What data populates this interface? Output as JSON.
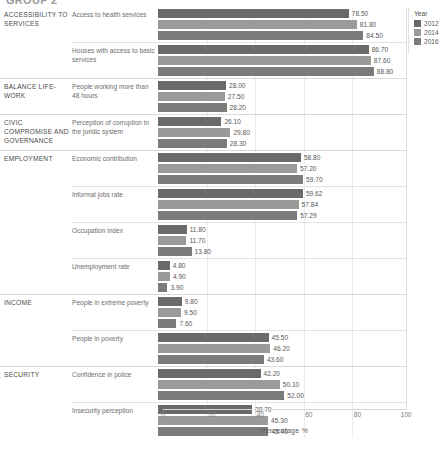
{
  "title": "GROUP 2",
  "axis": {
    "title": "Percentage %",
    "ticks": [
      "0",
      "20",
      "40",
      "60",
      "80",
      "100"
    ]
  },
  "legend": {
    "title": "Year",
    "items": [
      {
        "label": "2012",
        "color": "#6a6a6a"
      },
      {
        "label": "2014",
        "color": "#9a9a9a"
      },
      {
        "label": "2016",
        "color": "#7b7b7b"
      }
    ]
  },
  "chart_data": {
    "type": "bar",
    "orientation": "horizontal",
    "title": "GROUP 2",
    "xlabel": "Percentage %",
    "ylabel": "",
    "xlim": [
      0,
      100
    ],
    "xticks": [
      0,
      20,
      40,
      60,
      80,
      100
    ],
    "grid": true,
    "legend_title": "Year",
    "legend_position": "right",
    "series": [
      {
        "name": "2012",
        "color": "#6a6a6a"
      },
      {
        "name": "2014",
        "color": "#9a9a9a"
      },
      {
        "name": "2016",
        "color": "#7b7b7b"
      }
    ],
    "categories": [
      "Access to health services",
      "Houses with access to basic services",
      "People working more than 48 hours",
      "Perception of corruption in the juridic system",
      "Economic contribution",
      "Informal jobs rate",
      "Occupation index",
      "Unemployment rate",
      "People in extreme poverty",
      "People in poverty",
      "Confidence in police",
      "Insecurity perception"
    ],
    "values": {
      "2012": [
        78.5,
        86.7,
        28.0,
        26.1,
        58.8,
        59.62,
        11.8,
        4.8,
        9.8,
        45.5,
        42.2,
        38.7
      ],
      "2014": [
        81.8,
        87.6,
        27.5,
        29.8,
        57.2,
        57.84,
        11.7,
        4.9,
        9.5,
        46.2,
        50.1,
        45.3
      ],
      "2016": [
        84.5,
        88.8,
        28.2,
        28.3,
        59.7,
        57.29,
        13.8,
        3.9,
        7.6,
        43.6,
        52.0,
        45.4
      ]
    }
  },
  "groups": [
    {
      "dimension": "ACCESSIBILITY TO SERVICES",
      "indicators": [
        {
          "label": "Access to health services",
          "bars": [
            {
              "year": "2012",
              "value": 78.5,
              "value_label": "78.50"
            },
            {
              "year": "2014",
              "value": 81.8,
              "value_label": "81.80"
            },
            {
              "year": "2016",
              "value": 84.5,
              "value_label": "84.50"
            }
          ]
        },
        {
          "label": "Houses with access to basic services",
          "bars": [
            {
              "year": "2012",
              "value": 86.7,
              "value_label": "86.70"
            },
            {
              "year": "2014",
              "value": 87.6,
              "value_label": "87.60"
            },
            {
              "year": "2016",
              "value": 88.8,
              "value_label": "88.80"
            }
          ]
        }
      ]
    },
    {
      "dimension": "BALANCE LIFE-WORK",
      "indicators": [
        {
          "label": "People working more than 48 hours",
          "bars": [
            {
              "year": "2012",
              "value": 28.0,
              "value_label": "28.00"
            },
            {
              "year": "2014",
              "value": 27.5,
              "value_label": "27.50"
            },
            {
              "year": "2016",
              "value": 28.2,
              "value_label": "28.20"
            }
          ]
        }
      ]
    },
    {
      "dimension": "CIVIC COMPROMISE AND GOVERNANCE",
      "indicators": [
        {
          "label": "Perception of corruption in the juridic system",
          "bars": [
            {
              "year": "2012",
              "value": 26.1,
              "value_label": "26.10"
            },
            {
              "year": "2014",
              "value": 29.8,
              "value_label": "29.80"
            },
            {
              "year": "2016",
              "value": 28.3,
              "value_label": "28.30"
            }
          ]
        }
      ]
    },
    {
      "dimension": "EMPLOYMENT",
      "indicators": [
        {
          "label": "Economic contribution",
          "bars": [
            {
              "year": "2012",
              "value": 58.8,
              "value_label": "58.80"
            },
            {
              "year": "2014",
              "value": 57.2,
              "value_label": "57.20"
            },
            {
              "year": "2016",
              "value": 59.7,
              "value_label": "59.70"
            }
          ]
        },
        {
          "label": "Informal jobs rate",
          "bars": [
            {
              "year": "2012",
              "value": 59.62,
              "value_label": "59.62"
            },
            {
              "year": "2014",
              "value": 57.84,
              "value_label": "57.84"
            },
            {
              "year": "2016",
              "value": 57.29,
              "value_label": "57.29"
            }
          ]
        },
        {
          "label": "Occupation index",
          "bars": [
            {
              "year": "2012",
              "value": 11.8,
              "value_label": "11.80"
            },
            {
              "year": "2014",
              "value": 11.7,
              "value_label": "11.70"
            },
            {
              "year": "2016",
              "value": 13.8,
              "value_label": "13.80"
            }
          ]
        },
        {
          "label": "Unemployment rate",
          "bars": [
            {
              "year": "2012",
              "value": 4.8,
              "value_label": "4.80"
            },
            {
              "year": "2014",
              "value": 4.9,
              "value_label": "4.90"
            },
            {
              "year": "2016",
              "value": 3.9,
              "value_label": "3.90"
            }
          ]
        }
      ]
    },
    {
      "dimension": "INCOME",
      "indicators": [
        {
          "label": "People in extreme poverty",
          "bars": [
            {
              "year": "2012",
              "value": 9.8,
              "value_label": "9.80"
            },
            {
              "year": "2014",
              "value": 9.5,
              "value_label": "9.50"
            },
            {
              "year": "2016",
              "value": 7.6,
              "value_label": "7.60"
            }
          ]
        },
        {
          "label": "People in poverty",
          "bars": [
            {
              "year": "2012",
              "value": 45.5,
              "value_label": "45.50"
            },
            {
              "year": "2014",
              "value": 46.2,
              "value_label": "46.20"
            },
            {
              "year": "2016",
              "value": 43.6,
              "value_label": "43.60"
            }
          ]
        }
      ]
    },
    {
      "dimension": "SECURITY",
      "indicators": [
        {
          "label": "Confidence in police",
          "bars": [
            {
              "year": "2012",
              "value": 42.2,
              "value_label": "42.20"
            },
            {
              "year": "2014",
              "value": 50.1,
              "value_label": "50.10"
            },
            {
              "year": "2016",
              "value": 52.0,
              "value_label": "52.00"
            }
          ]
        },
        {
          "label": "Insecurity perception",
          "bars": [
            {
              "year": "2012",
              "value": 38.7,
              "value_label": "38.70"
            },
            {
              "year": "2014",
              "value": 45.3,
              "value_label": "45.30"
            },
            {
              "year": "2016",
              "value": 45.4,
              "value_label": "45.40"
            }
          ]
        }
      ]
    }
  ]
}
